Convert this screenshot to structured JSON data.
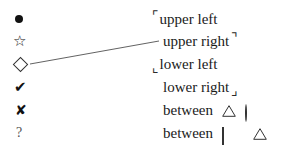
{
  "figure": {
    "kind": "symbol-legend",
    "background_color": "#ffffff",
    "ink_color": "#1a1a1a",
    "rows": [
      {
        "symbol_name": "filled-circle-symbol",
        "symbol_glyph": "●",
        "label": "upper left",
        "bracket_leading": "⌜",
        "bracket_trailing": "",
        "shapes": []
      },
      {
        "symbol_name": "star-outline-symbol",
        "symbol_glyph": "☆",
        "label": "upper right",
        "bracket_leading": "",
        "bracket_trailing": "⌝",
        "shapes": []
      },
      {
        "symbol_name": "diamond-outline-symbol",
        "symbol_glyph": "◇",
        "label": "lower left",
        "bracket_leading": "⌞",
        "bracket_trailing": "",
        "shapes": []
      },
      {
        "symbol_name": "check-mark-symbol",
        "symbol_glyph": "✔",
        "label": "lower right",
        "bracket_leading": "",
        "bracket_trailing": "⌟",
        "shapes": []
      },
      {
        "symbol_name": "ballot-x-symbol",
        "symbol_glyph": "✘",
        "label": "between",
        "bracket_leading": "",
        "bracket_trailing": "",
        "shapes": [
          "triangle",
          "circle"
        ]
      },
      {
        "symbol_name": "question-mark-symbol",
        "symbol_glyph": "?",
        "label": "between",
        "bracket_leading": "",
        "bracket_trailing": "",
        "shapes": [
          "rectangle",
          "triangle"
        ]
      }
    ],
    "connector": {
      "name": "diamond-to-upper-right-leader-line",
      "from_x": 30,
      "from_y": 64,
      "to_x": 159,
      "to_y": 41,
      "color": "#3a3a3a",
      "width": 0.8
    }
  }
}
